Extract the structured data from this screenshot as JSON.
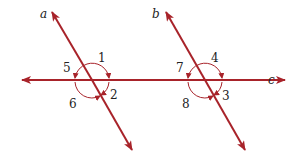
{
  "colors": {
    "line": "#a8232a",
    "text": "#222222",
    "background": "#ffffff"
  },
  "lines": {
    "a": {
      "label": "a"
    },
    "b": {
      "label": "b"
    },
    "c": {
      "label": "c"
    }
  },
  "angles": {
    "left_intersection": [
      "1",
      "2",
      "6",
      "5"
    ],
    "right_intersection": [
      "4",
      "3",
      "8",
      "7"
    ]
  }
}
